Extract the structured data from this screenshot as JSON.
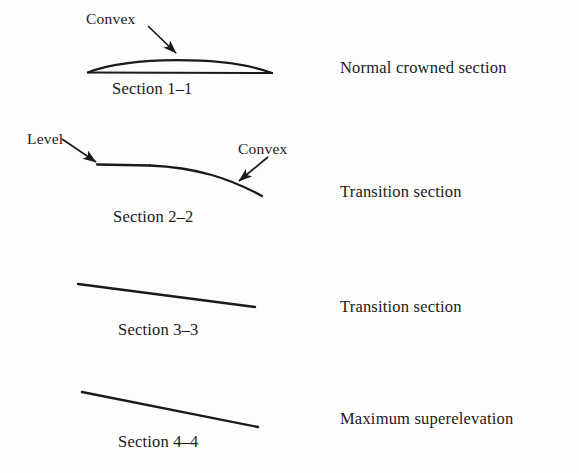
{
  "figure": {
    "background_color": "#fdfdfb",
    "ink_color": "#1a1a1a"
  },
  "sections": [
    {
      "id": "section-1",
      "caption": "Section 1–1",
      "description": "Normal crowned section",
      "shape": "crown-lens",
      "annotations": [
        {
          "name": "convex",
          "label": "Convex"
        }
      ]
    },
    {
      "id": "section-2",
      "caption": "Section 2–2",
      "description": "Transition section",
      "shape": "level-then-convex-curve",
      "annotations": [
        {
          "name": "level",
          "label": "Level"
        },
        {
          "name": "convex",
          "label": "Convex"
        }
      ]
    },
    {
      "id": "section-3",
      "caption": "Section 3–3",
      "description": "Transition section",
      "shape": "straight-slope-moderate",
      "annotations": []
    },
    {
      "id": "section-4",
      "caption": "Section 4–4",
      "description": "Maximum superelevation",
      "shape": "straight-slope-steep",
      "annotations": []
    }
  ]
}
